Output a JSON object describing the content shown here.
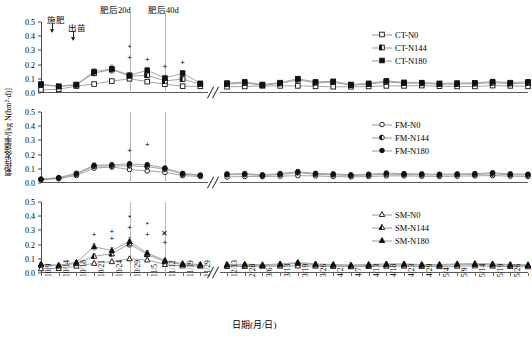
{
  "axis": {
    "y_title": "氨挥发速率/[kg N(hm²·d)]",
    "x_title": "日期(月/日)",
    "y_ticks": [
      "0.0",
      "0.1",
      "0.2",
      "0.3",
      "0.4",
      "0.5"
    ],
    "y_min": 0.0,
    "y_max": 0.5,
    "x_ticks": [
      "10/9",
      "10/14",
      "10/18",
      "10/21",
      "10/24",
      "10/29",
      "11/5",
      "11/12",
      "11/19",
      "11/29",
      "12/13",
      "2/28",
      "3/6",
      "3/13",
      "3/19",
      "3/26",
      "4/2",
      "4/7",
      "4/13",
      "4/18",
      "4/23",
      "4/29",
      "5/4",
      "5/9",
      "5/14",
      "5/19",
      "5/26",
      "6/2"
    ]
  },
  "annotations": {
    "fertilization": "施肥",
    "emergence": "出苗",
    "after20d": "肥后20d",
    "after40d": "肥后40d"
  },
  "legends": [
    {
      "title": "CT",
      "entries": [
        {
          "label": "CT-N0",
          "marker": "square-open"
        },
        {
          "label": "CT-N144",
          "marker": "square-half"
        },
        {
          "label": "CT-N180",
          "marker": "square-filled"
        }
      ]
    },
    {
      "title": "FM",
      "entries": [
        {
          "label": "FM-N0",
          "marker": "circle-open"
        },
        {
          "label": "FM-N144",
          "marker": "circle-half"
        },
        {
          "label": "FM-N180",
          "marker": "circle-filled"
        }
      ]
    },
    {
      "title": "SM",
      "entries": [
        {
          "label": "SM-N0",
          "marker": "triangle-open"
        },
        {
          "label": "SM-N144",
          "marker": "triangle-half"
        },
        {
          "label": "SM-N180",
          "marker": "triangle-filled"
        }
      ]
    }
  ],
  "chart_data": {
    "type": "line",
    "title": "",
    "xlabel": "日期(月/日)",
    "ylabel": "氨挥发速率/[kg N(hm²·d)]",
    "ylim": [
      0.0,
      0.5
    ],
    "grid": false,
    "legend_position": "top-right of each panel",
    "axis_break_after_index": 9,
    "x": [
      "10/9",
      "10/14",
      "10/18",
      "10/21",
      "10/24",
      "10/29",
      "11/5",
      "11/12",
      "11/19",
      "11/29",
      "12/13",
      "2/28",
      "3/6",
      "3/13",
      "3/19",
      "3/26",
      "4/2",
      "4/7",
      "4/13",
      "4/18",
      "4/23",
      "4/29",
      "5/4",
      "5/9",
      "5/14",
      "5/19",
      "5/26",
      "6/2"
    ],
    "panels": [
      {
        "name": "CT",
        "marker_shape": "square",
        "series": [
          {
            "name": "CT-N0",
            "fill": "open",
            "values": [
              0.022,
              0.026,
              0.049,
              0.063,
              0.084,
              0.1,
              0.08,
              0.062,
              0.048,
              0.047,
              0.044,
              0.046,
              0.05,
              0.05,
              0.05,
              0.047,
              0.044,
              0.044,
              0.046,
              0.05,
              0.05,
              0.052,
              0.048,
              0.046,
              0.046,
              0.052,
              0.05,
              0.047
            ],
            "errors": [
              0.006,
              0.006,
              0.008,
              0.009,
              0.011,
              0.012,
              0.01,
              0.009,
              0.008,
              0.008,
              0.008,
              0.008,
              0.009,
              0.009,
              0.009,
              0.008,
              0.008,
              0.008,
              0.008,
              0.009,
              0.009,
              0.009,
              0.008,
              0.008,
              0.008,
              0.009,
              0.009,
              0.008
            ]
          },
          {
            "name": "CT-N144",
            "fill": "half",
            "values": [
              0.058,
              0.046,
              0.058,
              0.14,
              0.165,
              0.12,
              0.125,
              0.085,
              0.098,
              0.063,
              0.063,
              0.07,
              0.055,
              0.067,
              0.094,
              0.072,
              0.076,
              0.055,
              0.062,
              0.078,
              0.07,
              0.068,
              0.062,
              0.063,
              0.066,
              0.072,
              0.066,
              0.07
            ],
            "errors": [
              0.01,
              0.008,
              0.01,
              0.02,
              0.025,
              0.018,
              0.018,
              0.013,
              0.015,
              0.01,
              0.01,
              0.012,
              0.009,
              0.011,
              0.015,
              0.012,
              0.013,
              0.009,
              0.01,
              0.013,
              0.012,
              0.011,
              0.01,
              0.01,
              0.011,
              0.012,
              0.011,
              0.012
            ]
          },
          {
            "name": "CT-N180",
            "fill": "filled",
            "values": [
              0.063,
              0.047,
              0.06,
              0.15,
              0.17,
              0.125,
              0.16,
              0.105,
              0.14,
              0.068,
              0.07,
              0.078,
              0.06,
              0.073,
              0.1,
              0.078,
              0.082,
              0.06,
              0.068,
              0.085,
              0.075,
              0.073,
              0.068,
              0.07,
              0.072,
              0.08,
              0.073,
              0.078
            ],
            "errors": [
              0.012,
              0.009,
              0.011,
              0.022,
              0.028,
              0.02,
              0.022,
              0.015,
              0.018,
              0.012,
              0.012,
              0.014,
              0.01,
              0.012,
              0.017,
              0.013,
              0.014,
              0.01,
              0.011,
              0.015,
              0.013,
              0.012,
              0.011,
              0.011,
              0.012,
              0.014,
              0.012,
              0.013
            ]
          }
        ],
        "significance": [
          {
            "x_index": 5,
            "value": 0.315,
            "symbol": "*"
          },
          {
            "x_index": 5,
            "value": 0.245,
            "symbol": "+"
          },
          {
            "x_index": 6,
            "value": 0.232,
            "symbol": "+"
          },
          {
            "x_index": 7,
            "value": 0.185,
            "symbol": "+"
          },
          {
            "x_index": 8,
            "value": 0.21,
            "symbol": "+"
          }
        ]
      },
      {
        "name": "FM",
        "marker_shape": "circle",
        "series": [
          {
            "name": "FM-N0",
            "fill": "open",
            "values": [
              0.022,
              0.03,
              0.053,
              0.105,
              0.113,
              0.095,
              0.085,
              0.075,
              0.052,
              0.046,
              0.042,
              0.046,
              0.045,
              0.048,
              0.052,
              0.05,
              0.046,
              0.043,
              0.046,
              0.05,
              0.05,
              0.048,
              0.046,
              0.048,
              0.05,
              0.052,
              0.048,
              0.046
            ],
            "errors": [
              0.006,
              0.007,
              0.009,
              0.013,
              0.014,
              0.012,
              0.011,
              0.01,
              0.009,
              0.008,
              0.008,
              0.008,
              0.008,
              0.008,
              0.009,
              0.009,
              0.008,
              0.008,
              0.008,
              0.009,
              0.009,
              0.008,
              0.008,
              0.008,
              0.009,
              0.009,
              0.008,
              0.008
            ]
          },
          {
            "name": "FM-N144",
            "fill": "half",
            "values": [
              0.025,
              0.035,
              0.062,
              0.118,
              0.12,
              0.122,
              0.115,
              0.098,
              0.062,
              0.052,
              0.058,
              0.06,
              0.052,
              0.06,
              0.072,
              0.062,
              0.058,
              0.052,
              0.056,
              0.062,
              0.06,
              0.058,
              0.056,
              0.058,
              0.06,
              0.064,
              0.058,
              0.056
            ],
            "errors": [
              0.007,
              0.008,
              0.01,
              0.015,
              0.015,
              0.016,
              0.015,
              0.013,
              0.01,
              0.009,
              0.01,
              0.01,
              0.009,
              0.01,
              0.012,
              0.01,
              0.01,
              0.009,
              0.009,
              0.01,
              0.01,
              0.01,
              0.009,
              0.01,
              0.01,
              0.011,
              0.01,
              0.009
            ]
          },
          {
            "name": "FM-N180",
            "fill": "filled",
            "values": [
              0.028,
              0.038,
              0.068,
              0.125,
              0.128,
              0.135,
              0.128,
              0.105,
              0.068,
              0.056,
              0.064,
              0.066,
              0.058,
              0.066,
              0.08,
              0.068,
              0.064,
              0.058,
              0.062,
              0.07,
              0.066,
              0.064,
              0.062,
              0.064,
              0.066,
              0.072,
              0.064,
              0.062
            ],
            "errors": [
              0.008,
              0.009,
              0.011,
              0.016,
              0.016,
              0.018,
              0.016,
              0.014,
              0.011,
              0.01,
              0.011,
              0.011,
              0.01,
              0.011,
              0.013,
              0.011,
              0.011,
              0.01,
              0.01,
              0.012,
              0.011,
              0.011,
              0.01,
              0.011,
              0.011,
              0.012,
              0.011,
              0.01
            ]
          }
        ],
        "significance": [
          {
            "x_index": 5,
            "value": 0.225,
            "symbol": "+"
          },
          {
            "x_index": 6,
            "value": 0.265,
            "symbol": "+"
          }
        ]
      },
      {
        "name": "SM",
        "marker_shape": "triangle",
        "series": [
          {
            "name": "SM-N0",
            "fill": "open",
            "values": [
              0.03,
              0.032,
              0.048,
              0.068,
              0.08,
              0.1,
              0.092,
              0.06,
              0.05,
              0.048,
              0.046,
              0.046,
              0.048,
              0.048,
              0.05,
              0.048,
              0.046,
              0.044,
              0.046,
              0.048,
              0.048,
              0.046,
              0.045,
              0.048,
              0.05,
              0.048,
              0.046,
              0.044
            ],
            "errors": [
              0.007,
              0.007,
              0.009,
              0.01,
              0.011,
              0.013,
              0.012,
              0.01,
              0.009,
              0.008,
              0.008,
              0.008,
              0.008,
              0.008,
              0.009,
              0.008,
              0.008,
              0.008,
              0.008,
              0.008,
              0.008,
              0.008,
              0.008,
              0.008,
              0.009,
              0.008,
              0.008,
              0.008
            ]
          },
          {
            "name": "SM-N144",
            "fill": "half",
            "values": [
              0.056,
              0.05,
              0.068,
              0.118,
              0.135,
              0.205,
              0.13,
              0.08,
              0.06,
              0.055,
              0.055,
              0.056,
              0.052,
              0.058,
              0.068,
              0.058,
              0.055,
              0.05,
              0.054,
              0.058,
              0.058,
              0.055,
              0.055,
              0.058,
              0.06,
              0.058,
              0.055,
              0.052
            ],
            "errors": [
              0.01,
              0.009,
              0.011,
              0.016,
              0.018,
              0.025,
              0.017,
              0.012,
              0.01,
              0.01,
              0.01,
              0.01,
              0.009,
              0.01,
              0.011,
              0.01,
              0.01,
              0.009,
              0.009,
              0.01,
              0.01,
              0.01,
              0.01,
              0.01,
              0.011,
              0.01,
              0.01,
              0.009
            ]
          },
          {
            "name": "SM-N180",
            "fill": "filled",
            "values": [
              0.062,
              0.055,
              0.075,
              0.185,
              0.158,
              0.222,
              0.14,
              0.088,
              0.066,
              0.06,
              0.06,
              0.062,
              0.058,
              0.064,
              0.074,
              0.064,
              0.06,
              0.056,
              0.06,
              0.064,
              0.064,
              0.06,
              0.06,
              0.064,
              0.066,
              0.064,
              0.06,
              0.058
            ],
            "errors": [
              0.011,
              0.01,
              0.012,
              0.022,
              0.02,
              0.028,
              0.018,
              0.013,
              0.011,
              0.011,
              0.011,
              0.011,
              0.01,
              0.011,
              0.012,
              0.011,
              0.011,
              0.01,
              0.01,
              0.011,
              0.011,
              0.011,
              0.011,
              0.011,
              0.012,
              0.011,
              0.011,
              0.01
            ]
          }
        ],
        "significance": [
          {
            "x_index": 3,
            "value": 0.27,
            "symbol": "+"
          },
          {
            "x_index": 4,
            "value": 0.29,
            "symbol": "+"
          },
          {
            "x_index": 4,
            "value": 0.238,
            "symbol": "+"
          },
          {
            "x_index": 5,
            "value": 0.385,
            "symbol": "*"
          },
          {
            "x_index": 5,
            "value": 0.315,
            "symbol": "+"
          },
          {
            "x_index": 6,
            "value": 0.34,
            "symbol": "*"
          },
          {
            "x_index": 6,
            "value": 0.27,
            "symbol": "+"
          },
          {
            "x_index": 7,
            "value": 0.272,
            "symbol": "✕"
          },
          {
            "x_index": 7,
            "value": 0.21,
            "symbol": "+"
          }
        ]
      }
    ]
  }
}
